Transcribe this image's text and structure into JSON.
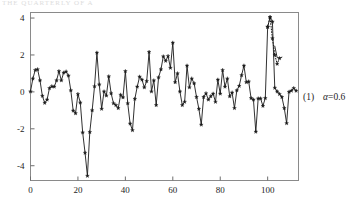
{
  "page_bleed_text": "THE  QUARTERLY   OF  A",
  "caption": {
    "index": "(1)",
    "param_name": "α",
    "param_eq": "=",
    "param_value": "0.6"
  },
  "chart_data": {
    "type": "line",
    "title": "",
    "subtitle": "",
    "xlabel": "",
    "ylabel": "",
    "xlim": [
      0,
      113
    ],
    "ylim": [
      -4.8,
      4.3
    ],
    "xticks": [
      0,
      20,
      40,
      60,
      80,
      100
    ],
    "xtick_labels": [
      "0",
      "20",
      "40",
      "60",
      "80",
      "100"
    ],
    "yticks": [
      -4,
      -2,
      0,
      2,
      4
    ],
    "ytick_labels": [
      "-4",
      "-2",
      "0",
      "2",
      "4"
    ],
    "grid": false,
    "legend": "none",
    "marker": "star",
    "series": [
      {
        "name": "observed",
        "style": "solid",
        "color": "#1a1a1a",
        "x": [
          0,
          1,
          2,
          3,
          4,
          5,
          6,
          7,
          8,
          9,
          10,
          11,
          12,
          13,
          14,
          15,
          16,
          17,
          18,
          19,
          20,
          21,
          22,
          23,
          24,
          25,
          26,
          27,
          28,
          29,
          30,
          31,
          32,
          33,
          34,
          35,
          36,
          37,
          38,
          39,
          40,
          41,
          42,
          43,
          44,
          45,
          46,
          47,
          48,
          49,
          50,
          51,
          52,
          53,
          54,
          55,
          56,
          57,
          58,
          59,
          60,
          61,
          62,
          63,
          64,
          65,
          66,
          67,
          68,
          69,
          70,
          71,
          72,
          73,
          74,
          75,
          76,
          77,
          78,
          79,
          80,
          81,
          82,
          83,
          84,
          85,
          86,
          87,
          88,
          89,
          90,
          91,
          92,
          93,
          94,
          95,
          96,
          97,
          98,
          99,
          100,
          101,
          102,
          103,
          104,
          105,
          106,
          107,
          108,
          109,
          110,
          111,
          112
        ],
        "y": [
          0.02,
          0.72,
          1.18,
          1.22,
          0.62,
          -0.22,
          -0.6,
          -0.42,
          0.2,
          0.3,
          0.28,
          0.62,
          1.12,
          0.62,
          1.04,
          1.1,
          0.88,
          0.08,
          -1.02,
          -1.16,
          -0.12,
          -0.58,
          -2.2,
          -3.3,
          -4.55,
          -2.18,
          -1.0,
          0.3,
          2.12,
          0.4,
          -0.92,
          0.02,
          -0.2,
          0.84,
          -0.08,
          -0.62,
          -0.72,
          -0.88,
          -0.16,
          -0.3,
          1.12,
          -0.62,
          -1.72,
          -2.08,
          -0.38,
          0.28,
          0.82,
          0.66,
          0.24,
          0.58,
          2.16,
          0.02,
          0.62,
          -0.72,
          0.78,
          1.22,
          1.92,
          1.68,
          1.94,
          1.3,
          2.66,
          0.52,
          1.0,
          0.02,
          -0.72,
          -0.54,
          1.42,
          0.24,
          0.72,
          0.46,
          -0.28,
          -0.92,
          -1.78,
          -0.28,
          -0.08,
          -0.42,
          -0.24,
          -0.1,
          -0.54,
          0.66,
          -0.1,
          1.18,
          0.28,
          0.72,
          -0.24,
          -0.04,
          -0.88,
          0.08,
          0.32,
          0.9,
          1.42,
          0.52,
          0.56,
          -0.34,
          -0.42,
          -2.16,
          -0.36,
          -0.36,
          -0.76,
          -0.34,
          3.52,
          4.04,
          3.8,
          0.22,
          0.02,
          -0.12,
          -0.28,
          -0.88,
          -1.7,
          0.0,
          0.06,
          0.2,
          0.06
        ]
      },
      {
        "name": "forecast",
        "style": "dotted",
        "color": "#1a1a1a",
        "x": [
          100,
          101,
          102,
          103,
          104,
          105
        ],
        "y": [
          3.52,
          4.04,
          2.9,
          2.0,
          1.52,
          1.82
        ]
      },
      {
        "name": "forecast-tail",
        "style": "solid",
        "color": "#1a1a1a",
        "x": [
          103,
          104,
          105,
          106
        ],
        "y": [
          2.48,
          1.86,
          1.82,
          1.88
        ]
      }
    ]
  }
}
